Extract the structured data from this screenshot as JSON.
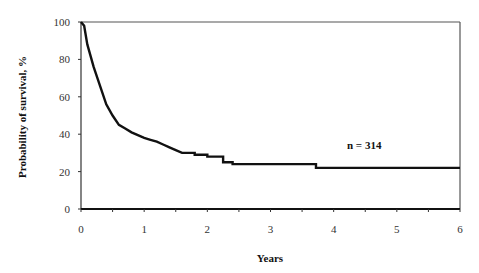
{
  "chart_data": {
    "type": "line",
    "title": "",
    "xlabel": "Years",
    "ylabel": "Probability of survival, %",
    "xlim": [
      0,
      6
    ],
    "ylim": [
      0,
      100
    ],
    "x_ticks": [
      "0",
      "1",
      "2",
      "3",
      "4",
      "5",
      "6"
    ],
    "y_ticks": [
      "0",
      "20",
      "40",
      "60",
      "80",
      "100"
    ],
    "grid": false,
    "legend": null,
    "annotations": [
      {
        "text": "n = 314",
        "x": 4.1,
        "y": 33
      }
    ],
    "series": [
      {
        "name": "Survival",
        "step": true,
        "x": [
          0,
          0.05,
          0.1,
          0.15,
          0.2,
          0.3,
          0.4,
          0.5,
          0.6,
          0.7,
          0.8,
          0.9,
          1.0,
          1.1,
          1.2,
          1.3,
          1.4,
          1.5,
          1.6,
          1.8,
          1.9,
          2.0,
          2.2,
          2.25,
          2.4,
          2.6,
          3.0,
          3.3,
          3.6,
          3.7,
          3.72,
          4.0,
          5.0,
          6.0
        ],
        "y": [
          100,
          98,
          88,
          82,
          76,
          66,
          56,
          50,
          45,
          43,
          41,
          39.5,
          38,
          37,
          36,
          34.5,
          33,
          31.5,
          30,
          29,
          29,
          28,
          28,
          25,
          24,
          24,
          24,
          24,
          24,
          24,
          22,
          22,
          22,
          22
        ]
      }
    ]
  },
  "labels": {
    "xlabel": "Years",
    "ylabel": "Probability of survival, %",
    "annotation": "n = 314",
    "x_ticks": [
      "0",
      "1",
      "2",
      "3",
      "4",
      "5",
      "6"
    ],
    "y_ticks": [
      "0",
      "20",
      "40",
      "60",
      "80",
      "100"
    ]
  },
  "colors": {
    "line": "#111111",
    "axis": "#333333",
    "frame": "#555555"
  }
}
